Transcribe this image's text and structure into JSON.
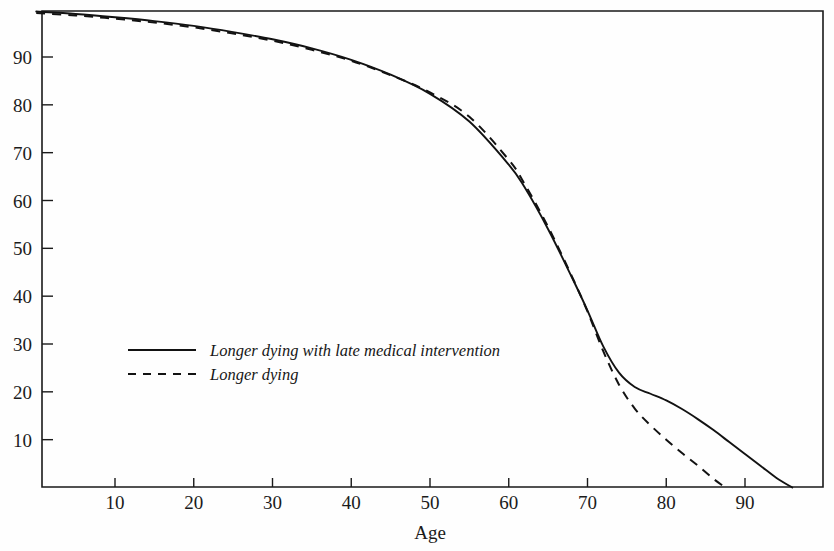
{
  "chart_data": {
    "type": "line",
    "title": "",
    "subtitle": "",
    "xlabel": "Age",
    "ylabel": "",
    "xlim": [
      0,
      100
    ],
    "ylim": [
      0,
      100
    ],
    "grid": false,
    "legend_position": "inside-left-middle",
    "x_ticks": [
      10,
      20,
      30,
      40,
      50,
      60,
      70,
      80,
      90
    ],
    "x_tick_labels": [
      "10",
      "20",
      "30",
      "40",
      "50",
      "60",
      "70",
      "80",
      "90"
    ],
    "y_ticks": [
      10,
      20,
      30,
      40,
      50,
      60,
      70,
      80,
      90
    ],
    "y_tick_labels": [
      "10",
      "20",
      "30",
      "40",
      "50",
      "60",
      "70",
      "80",
      "90"
    ],
    "series": [
      {
        "name": "Longer dying with late medical intervention",
        "style": "solid",
        "color": "#121212",
        "x": [
          0,
          5,
          10,
          15,
          20,
          25,
          30,
          35,
          40,
          45,
          50,
          55,
          60,
          62,
          65,
          68,
          70,
          72,
          74,
          76,
          78,
          80,
          82,
          84,
          86,
          88,
          90,
          92,
          94,
          96
        ],
        "y": [
          99.5,
          99.0,
          98.3,
          97.5,
          96.5,
          95.2,
          93.7,
          91.8,
          89.4,
          86.3,
          82.3,
          76.5,
          67.5,
          62.8,
          54.0,
          44.0,
          37.0,
          29.5,
          24.0,
          21.0,
          19.6,
          18.2,
          16.4,
          14.3,
          12.0,
          9.5,
          7.0,
          4.5,
          2.0,
          0.0
        ]
      },
      {
        "name": "Longer dying",
        "style": "dashed",
        "color": "#121212",
        "x": [
          0,
          5,
          10,
          15,
          20,
          25,
          30,
          35,
          40,
          45,
          50,
          55,
          60,
          62,
          65,
          68,
          70,
          72,
          74,
          76,
          78,
          80,
          82,
          84,
          86,
          87.5
        ],
        "y": [
          99.2,
          98.7,
          98.0,
          97.2,
          96.2,
          94.9,
          93.4,
          91.5,
          89.2,
          86.2,
          82.6,
          77.5,
          68.5,
          63.5,
          54.5,
          44.2,
          36.8,
          28.5,
          21.5,
          16.5,
          13.0,
          10.0,
          7.2,
          4.6,
          1.8,
          0.0
        ]
      }
    ],
    "legend": [
      {
        "label": "Longer dying with late medical intervention",
        "style": "solid"
      },
      {
        "label": "Longer dying",
        "style": "dashed"
      }
    ],
    "colors": {
      "line": "#121212",
      "axis": "#1a1a1a",
      "text": "#1b1b1b",
      "background": "#fefefe"
    }
  }
}
